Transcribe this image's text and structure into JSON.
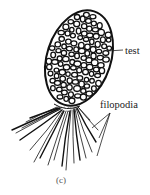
{
  "figure": {
    "panel_label": "(c)",
    "labels": {
      "test": "test",
      "filopodia": "filopodia"
    },
    "colors": {
      "ink": "#111111",
      "background": "#ffffff"
    }
  }
}
